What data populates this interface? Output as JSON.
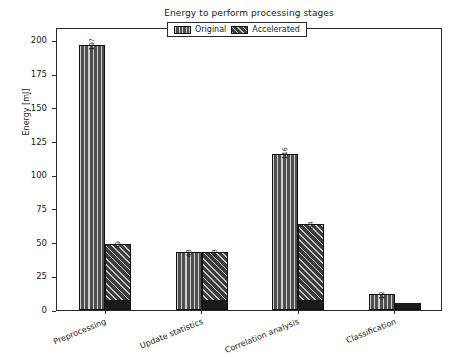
{
  "chart_data": {
    "type": "bar",
    "title": "Energy to perform processing stages",
    "xlabel": "",
    "ylabel": "Energy [mJ]",
    "categories": [
      "Preprocessing",
      "Update statistics",
      "Correlation analysis",
      "Classification"
    ],
    "series": [
      {
        "name": "Original",
        "values": [
          197,
          43,
          116,
          12
        ]
      },
      {
        "name": "Accelerated",
        "values": [
          49,
          43,
          64,
          5
        ]
      }
    ],
    "ylim": [
      0,
      210
    ],
    "yticks": [
      0,
      25,
      50,
      75,
      100,
      125,
      150,
      175,
      200
    ],
    "ytick_labels": [
      "0",
      "25",
      "50",
      "75",
      "100",
      "125",
      "150",
      "175",
      "200"
    ],
    "grid": false,
    "legend_position": "upper center",
    "bar_value_labels": true
  },
  "legend": {
    "entries": [
      {
        "label": "Original",
        "pattern": "vertical-hatch",
        "color": "#4f4f4f"
      },
      {
        "label": "Accelerated",
        "pattern": "diagonal-hatch",
        "color": "#3d3d3d"
      }
    ]
  },
  "axes": {
    "y_label": "Energy [mJ]",
    "y_ticks": [
      "0",
      "25",
      "50",
      "75",
      "100",
      "125",
      "150",
      "175",
      "200"
    ],
    "x_ticks": [
      "Preprocessing",
      "Update statistics",
      "Correlation analysis",
      "Classification"
    ]
  },
  "values": {
    "preprocessing": {
      "original": "197",
      "accelerated": "49"
    },
    "update_statistics": {
      "original": "43",
      "accelerated": "43"
    },
    "correlation_analysis": {
      "original": "116",
      "accelerated": "64"
    },
    "classification": {
      "original": "12",
      "accelerated": "5"
    }
  }
}
